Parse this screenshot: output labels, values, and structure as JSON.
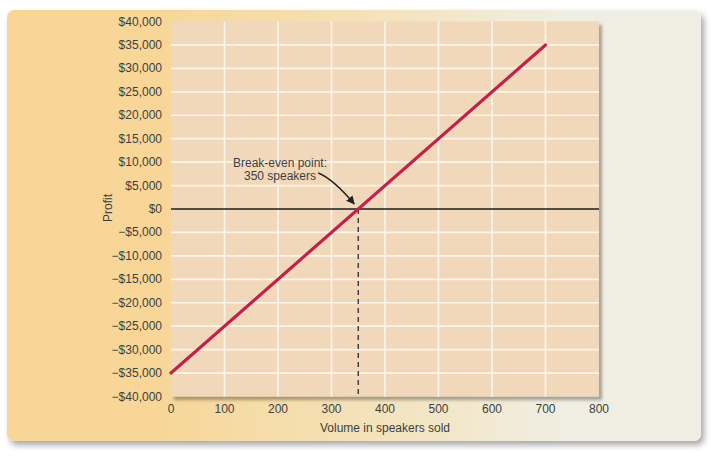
{
  "chart_data": {
    "type": "line",
    "title": "",
    "xlabel": "Volume in speakers sold",
    "ylabel": "Profit",
    "xlim": [
      0,
      800
    ],
    "ylim": [
      -40000,
      40000
    ],
    "grid": true,
    "legend": "none",
    "x_ticks": [
      {
        "v": 0,
        "label": "0"
      },
      {
        "v": 100,
        "label": "100"
      },
      {
        "v": 200,
        "label": "200"
      },
      {
        "v": 300,
        "label": "300"
      },
      {
        "v": 400,
        "label": "400"
      },
      {
        "v": 500,
        "label": "500"
      },
      {
        "v": 600,
        "label": "600"
      },
      {
        "v": 700,
        "label": "700"
      },
      {
        "v": 800,
        "label": "800"
      }
    ],
    "y_ticks": [
      {
        "v": 40000,
        "label": "$40,000"
      },
      {
        "v": 35000,
        "label": "$35,000"
      },
      {
        "v": 30000,
        "label": "$30,000"
      },
      {
        "v": 25000,
        "label": "$25,000"
      },
      {
        "v": 20000,
        "label": "$20,000"
      },
      {
        "v": 15000,
        "label": "$15,000"
      },
      {
        "v": 10000,
        "label": "$10,000"
      },
      {
        "v": 5000,
        "label": "$5,000"
      },
      {
        "v": 0,
        "label": "$0"
      },
      {
        "v": -5000,
        "label": "−$5,000"
      },
      {
        "v": -10000,
        "label": "−$10,000"
      },
      {
        "v": -15000,
        "label": "−$15,000"
      },
      {
        "v": -20000,
        "label": "−$20,000"
      },
      {
        "v": -25000,
        "label": "−$25,000"
      },
      {
        "v": -30000,
        "label": "−$30,000"
      },
      {
        "v": -35000,
        "label": "−$35,000"
      },
      {
        "v": -40000,
        "label": "−$40,000"
      }
    ],
    "series": [
      {
        "name": "profit-line",
        "color": "#c0234a",
        "points": [
          [
            0,
            -35000
          ],
          [
            700,
            35000
          ]
        ]
      }
    ],
    "zero_line": true,
    "break_even": {
      "x": 350,
      "y": 0,
      "label_line1": "Break-even point:",
      "label_line2": "350 speakers",
      "dashed_line_to_bottom": true
    }
  },
  "colors": {
    "card_gradient_left": "#f7d697",
    "card_gradient_mid": "#f4e2ba",
    "card_gradient_right": "#f0eee2",
    "plot_bg": "#f2d8ba",
    "gridline": "#fbf4e8",
    "line": "#c0234a",
    "zero_line": "#1e1e1e",
    "dashed_line": "#2b2b2b",
    "arrow": "#222222",
    "text": "#3e3e3e"
  }
}
